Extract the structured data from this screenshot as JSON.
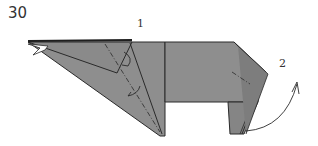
{
  "diagram": {
    "step_number": "30",
    "labels": [
      "1",
      "2"
    ],
    "colors": {
      "paper": "#8e8e8e",
      "paper_dark": "#7a7a7a",
      "outline": "#2a2a2a",
      "background": "#ffffff"
    }
  }
}
